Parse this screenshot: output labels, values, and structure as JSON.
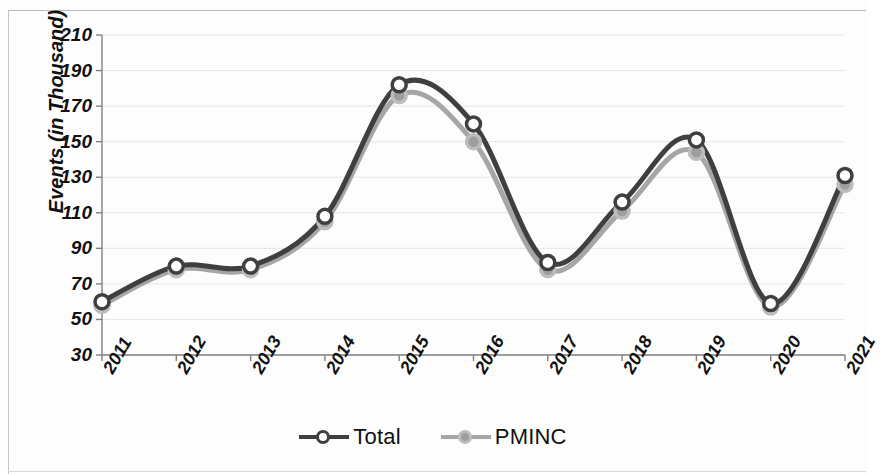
{
  "chart_data": {
    "type": "line",
    "title": "",
    "xlabel": "",
    "ylabel": "Events (in Thousand)",
    "categories": [
      "2011",
      "2012",
      "2013",
      "2014",
      "2015",
      "2016",
      "2017",
      "2018",
      "2019",
      "2020",
      "2021"
    ],
    "series": [
      {
        "name": "Total",
        "color": "#3f3f3f",
        "marker": "circle-open",
        "marker_fill": "#ffffff",
        "values": [
          60,
          80,
          80,
          108,
          182,
          160,
          82,
          116,
          151,
          59,
          131
        ]
      },
      {
        "name": "PMINC",
        "color": "#a6a6a6",
        "marker": "circle-filled",
        "marker_fill": "#a6a6a6",
        "values": [
          58,
          78,
          78,
          105,
          176,
          150,
          78,
          111,
          144,
          57,
          126
        ]
      }
    ],
    "ylim": [
      30,
      210
    ],
    "ytick_values": [
      30,
      50,
      70,
      90,
      110,
      130,
      150,
      170,
      190,
      210
    ],
    "ytick_labels": [
      "30",
      "50",
      "70",
      "90",
      "110",
      "130",
      "150",
      "170",
      "190",
      "210"
    ],
    "grid": "horizontal-light",
    "legend_position": "bottom-center",
    "legend_entries": [
      "Total",
      "PMINC"
    ],
    "smoothing": "spline"
  },
  "axis": {
    "y_title": "Events (in Thousand)"
  },
  "legend": {
    "items": [
      {
        "label": "Total"
      },
      {
        "label": "PMINC"
      }
    ]
  },
  "colors": {
    "total_line": "#3f3f3f",
    "pminc_line": "#a6a6a6",
    "axis": "#808080",
    "grid": "#e6e6e6",
    "background": "#fdfdfd"
  }
}
